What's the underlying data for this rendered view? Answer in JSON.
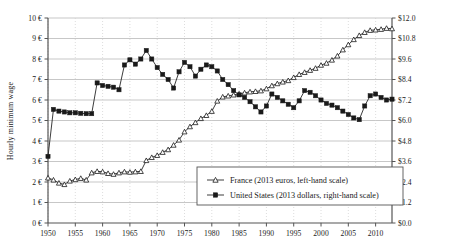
{
  "chart_data": {
    "type": "line",
    "title": "",
    "xlabel": "",
    "ylabel": "Hourly minimum wage",
    "xlim": [
      1950,
      2013
    ],
    "x_ticks": [
      1950,
      1955,
      1960,
      1965,
      1970,
      1975,
      1980,
      1985,
      1990,
      1995,
      2000,
      2005,
      2010
    ],
    "x_tick_labels": [
      "1950",
      "1955",
      "1960",
      "1965",
      "1970",
      "1975",
      "1980",
      "1985",
      "1990",
      "1995",
      "2000",
      "2005",
      "2010"
    ],
    "left_axis": {
      "label": "Hourly minimum wage",
      "ylim": [
        0,
        10
      ],
      "ticks": [
        0,
        1,
        2,
        3,
        4,
        5,
        6,
        7,
        8,
        9,
        10
      ],
      "tick_labels": [
        "0 €",
        "1 €",
        "2 €",
        "3 €",
        "4 €",
        "5 €",
        "6 €",
        "7 €",
        "8 €",
        "9 €",
        "10 €"
      ],
      "currency": "2013 euros"
    },
    "right_axis": {
      "ylim": [
        0,
        12
      ],
      "ticks": [
        0,
        1.2,
        2.4,
        3.6,
        4.8,
        6.0,
        7.2,
        8.4,
        9.6,
        10.8,
        12.0
      ],
      "tick_labels": [
        "$0.0",
        "$1.2",
        "$2.4",
        "$3.6",
        "$4.8",
        "$6.0",
        "$7.2",
        "$8.4",
        "$9.6",
        "$10.8",
        "$12.0"
      ],
      "currency": "2013 dollars"
    },
    "grid": true,
    "legend_position": "bottom-center",
    "series": [
      {
        "name": "France (2013 euros, left-hand scale)",
        "short_name": "France",
        "axis": "left",
        "marker": "open-triangle",
        "color": "#1a1a1a",
        "x": [
          1950,
          1951,
          1952,
          1953,
          1954,
          1955,
          1956,
          1957,
          1958,
          1959,
          1960,
          1961,
          1962,
          1963,
          1964,
          1965,
          1966,
          1967,
          1968,
          1969,
          1970,
          1971,
          1972,
          1973,
          1974,
          1975,
          1976,
          1977,
          1978,
          1979,
          1980,
          1981,
          1982,
          1983,
          1984,
          1985,
          1986,
          1987,
          1988,
          1989,
          1990,
          1991,
          1992,
          1993,
          1994,
          1995,
          1996,
          1997,
          1998,
          1999,
          2000,
          2001,
          2002,
          2003,
          2004,
          2005,
          2006,
          2007,
          2008,
          2009,
          2010,
          2011,
          2012,
          2013
        ],
        "y": [
          2.2,
          2.1,
          1.95,
          1.88,
          2.05,
          2.12,
          2.18,
          2.1,
          2.45,
          2.52,
          2.5,
          2.42,
          2.38,
          2.45,
          2.5,
          2.48,
          2.5,
          2.52,
          3.05,
          3.2,
          3.3,
          3.45,
          3.58,
          3.8,
          4.05,
          4.45,
          4.7,
          4.9,
          5.1,
          5.25,
          5.45,
          5.95,
          6.15,
          6.2,
          6.25,
          6.3,
          6.35,
          6.4,
          6.42,
          6.45,
          6.55,
          6.7,
          6.8,
          6.88,
          6.95,
          7.1,
          7.25,
          7.35,
          7.45,
          7.55,
          7.7,
          7.8,
          7.95,
          8.15,
          8.45,
          8.7,
          8.95,
          9.15,
          9.3,
          9.4,
          9.42,
          9.45,
          9.5,
          9.48
        ]
      },
      {
        "name": "United States (2013 dollars, right-hand scale)",
        "short_name": "United States",
        "axis": "right",
        "marker": "filled-square",
        "color": "#1a1a1a",
        "x": [
          1950,
          1951,
          1952,
          1953,
          1954,
          1955,
          1956,
          1957,
          1958,
          1959,
          1960,
          1961,
          1962,
          1963,
          1964,
          1965,
          1966,
          1967,
          1968,
          1969,
          1970,
          1971,
          1972,
          1973,
          1974,
          1975,
          1976,
          1977,
          1978,
          1979,
          1980,
          1981,
          1982,
          1983,
          1984,
          1985,
          1986,
          1987,
          1988,
          1989,
          1990,
          1991,
          1992,
          1993,
          1994,
          1995,
          1996,
          1997,
          1998,
          1999,
          2000,
          2001,
          2002,
          2003,
          2004,
          2005,
          2006,
          2007,
          2008,
          2009,
          2010,
          2011,
          2012,
          2013
        ],
        "y": [
          3.9,
          6.65,
          6.55,
          6.5,
          6.45,
          6.45,
          6.42,
          6.4,
          6.4,
          8.2,
          8.05,
          8.0,
          7.95,
          7.8,
          9.25,
          9.55,
          9.3,
          9.6,
          10.1,
          9.6,
          9.1,
          8.7,
          8.4,
          7.9,
          8.85,
          9.4,
          9.15,
          8.6,
          9.0,
          9.25,
          9.15,
          8.9,
          8.4,
          8.1,
          7.75,
          7.5,
          7.35,
          7.1,
          6.8,
          6.5,
          6.85,
          7.55,
          7.35,
          7.15,
          6.95,
          6.75,
          7.15,
          7.75,
          7.65,
          7.45,
          7.2,
          7.0,
          6.9,
          6.75,
          6.55,
          6.35,
          6.15,
          6.05,
          6.85,
          7.45,
          7.55,
          7.35,
          7.2,
          7.25
        ]
      }
    ],
    "legend_entries": [
      {
        "label": "France (2013 euros, left-hand scale)",
        "marker": "open-triangle"
      },
      {
        "label": "United States (2013 dollars, right-hand scale)",
        "marker": "filled-square"
      }
    ]
  },
  "colors": {
    "ink": "#1a1a1a",
    "grid": "#b9b9b9",
    "grid_vertical": "#cfcfcf",
    "axis": "#555555",
    "background": "#ffffff"
  }
}
